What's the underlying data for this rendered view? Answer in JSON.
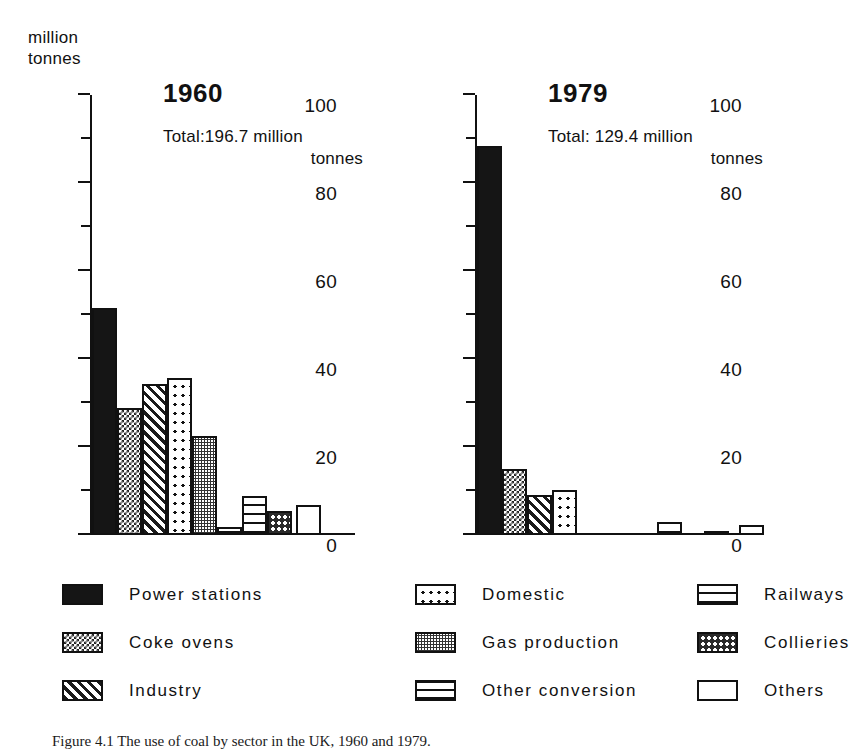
{
  "axis_title": "million\ntonnes",
  "axis_title_lines": [
    "million",
    "tonnes"
  ],
  "caption": "Figure 4.1  The use of coal by sector in the UK, 1960 and 1979.",
  "panels": [
    {
      "title": "1960",
      "total_line1": "Total:196.7 million",
      "total_line2": "tonnes"
    },
    {
      "title": "1979",
      "total_line1": "Total: 129.4 million",
      "total_line2": "tonnes"
    }
  ],
  "ticklabels": [
    "100",
    "80",
    "60",
    "40",
    "20",
    "0"
  ],
  "legend": [
    {
      "label": "Power stations",
      "pattern": "p-solid"
    },
    {
      "label": "Coke ovens",
      "pattern": "p-checker"
    },
    {
      "label": "Industry",
      "pattern": "p-diag"
    },
    {
      "label": "Domestic",
      "pattern": "p-dots"
    },
    {
      "label": "Gas production",
      "pattern": "p-grey"
    },
    {
      "label": "Other conversion",
      "pattern": "p-dash"
    },
    {
      "label": "Railways",
      "pattern": "p-hlines"
    },
    {
      "label": "Collieries",
      "pattern": "p-coarse"
    },
    {
      "label": "Others",
      "pattern": "p-white"
    }
  ],
  "chart_data": {
    "type": "bar",
    "title": "The use of coal by sector in the UK, 1960 and 1979",
    "xlabel": "",
    "ylabel": "million tonnes",
    "ylim": [
      0,
      100
    ],
    "yticks": [
      0,
      20,
      40,
      60,
      80,
      100
    ],
    "minor_tick_step": 10,
    "grid": false,
    "legend_position": "bottom",
    "categories": [
      "Power stations",
      "Coke ovens",
      "Industry",
      "Domestic",
      "Gas production",
      "Other conversion",
      "Railways",
      "Collieries",
      "Others"
    ],
    "series": [
      {
        "name": "1960",
        "total": 196.7,
        "values": [
          51.7,
          28.8,
          34.4,
          35.7,
          22.5,
          1.8,
          8.8,
          5.4,
          6.9
        ]
      },
      {
        "name": "1979",
        "total": 129.4,
        "values": [
          88.5,
          15.0,
          9.0,
          10.3,
          0.0,
          0.0,
          3.0,
          0.8,
          2.2
        ]
      }
    ],
    "units": "million tonnes"
  }
}
